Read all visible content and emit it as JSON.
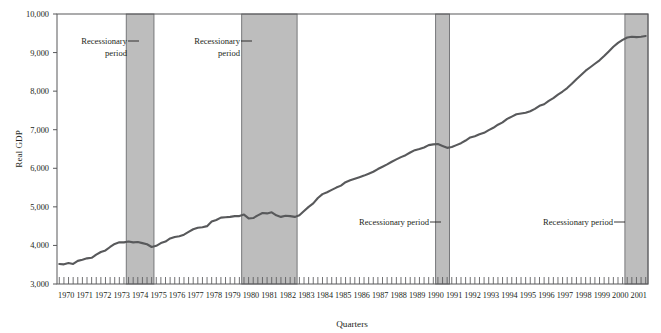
{
  "chart_data": {
    "type": "line",
    "title": "",
    "subtitle": "",
    "xlabel": "Quarters",
    "ylabel": "Real GDP",
    "ylim": [
      3000,
      10000
    ],
    "ytick_labels": [
      "10,000",
      "9,000",
      "8,000",
      "7,000",
      "6,000",
      "5,000",
      "4,000",
      "3,000"
    ],
    "ytick_values": [
      10000,
      9000,
      8000,
      7000,
      6000,
      5000,
      4000,
      3000
    ],
    "grid": false,
    "legend": "none",
    "xlim": [
      "1970Q1",
      "2001Q4"
    ],
    "xtick_labels": [
      "1970",
      "1971",
      "1972",
      "1973",
      "1974",
      "1975",
      "1976",
      "1977",
      "1978",
      "1979",
      "1980",
      "1981",
      "1982",
      "1983",
      "1984",
      "1985",
      "1986",
      "1987",
      "1988",
      "1989",
      "1990",
      "1991",
      "1992",
      "1993",
      "1994",
      "1995",
      "1996",
      "1997",
      "1998",
      "1999",
      "2000",
      "2001"
    ],
    "minor_ticks_per_year": 4,
    "line_color": "#58595b",
    "band_color": "#bdbdbd",
    "band_border_color": "#6d6e71",
    "series": [
      {
        "name": "Real GDP",
        "x": [
          "1970Q1",
          "1970Q2",
          "1970Q3",
          "1970Q4",
          "1971Q1",
          "1971Q2",
          "1971Q3",
          "1971Q4",
          "1972Q1",
          "1972Q2",
          "1972Q3",
          "1972Q4",
          "1973Q1",
          "1973Q2",
          "1973Q3",
          "1973Q4",
          "1974Q1",
          "1974Q2",
          "1974Q3",
          "1974Q4",
          "1975Q1",
          "1975Q2",
          "1975Q3",
          "1975Q4",
          "1976Q1",
          "1976Q2",
          "1976Q3",
          "1976Q4",
          "1977Q1",
          "1977Q2",
          "1977Q3",
          "1977Q4",
          "1978Q1",
          "1978Q2",
          "1978Q3",
          "1978Q4",
          "1979Q1",
          "1979Q2",
          "1979Q3",
          "1979Q4",
          "1980Q1",
          "1980Q2",
          "1980Q3",
          "1980Q4",
          "1981Q1",
          "1981Q2",
          "1981Q3",
          "1981Q4",
          "1982Q1",
          "1982Q2",
          "1982Q3",
          "1982Q4",
          "1983Q1",
          "1983Q2",
          "1983Q3",
          "1983Q4",
          "1984Q1",
          "1984Q2",
          "1984Q3",
          "1984Q4",
          "1985Q1",
          "1985Q2",
          "1985Q3",
          "1985Q4",
          "1986Q1",
          "1986Q2",
          "1986Q3",
          "1986Q4",
          "1987Q1",
          "1987Q2",
          "1987Q3",
          "1987Q4",
          "1988Q1",
          "1988Q2",
          "1988Q3",
          "1988Q4",
          "1989Q1",
          "1989Q2",
          "1989Q3",
          "1989Q4",
          "1990Q1",
          "1990Q2",
          "1990Q3",
          "1990Q4",
          "1991Q1",
          "1991Q2",
          "1991Q3",
          "1991Q4",
          "1992Q1",
          "1992Q2",
          "1992Q3",
          "1992Q4",
          "1993Q1",
          "1993Q2",
          "1993Q3",
          "1993Q4",
          "1994Q1",
          "1994Q2",
          "1994Q3",
          "1994Q4",
          "1995Q1",
          "1995Q2",
          "1995Q3",
          "1995Q4",
          "1996Q1",
          "1996Q2",
          "1996Q3",
          "1996Q4",
          "1997Q1",
          "1997Q2",
          "1997Q3",
          "1997Q4",
          "1998Q1",
          "1998Q2",
          "1998Q3",
          "1998Q4",
          "1999Q1",
          "1999Q2",
          "1999Q3",
          "1999Q4",
          "2000Q1",
          "2000Q2",
          "2000Q3",
          "2000Q4",
          "2001Q1",
          "2001Q2",
          "2001Q3",
          "2001Q4"
        ],
        "values": [
          3520,
          3510,
          3545,
          3520,
          3600,
          3630,
          3665,
          3680,
          3760,
          3830,
          3870,
          3960,
          4040,
          4080,
          4080,
          4100,
          4080,
          4090,
          4060,
          4030,
          3960,
          3990,
          4060,
          4100,
          4180,
          4220,
          4240,
          4280,
          4350,
          4420,
          4460,
          4470,
          4500,
          4620,
          4660,
          4720,
          4730,
          4740,
          4760,
          4760,
          4800,
          4700,
          4710,
          4780,
          4840,
          4830,
          4860,
          4780,
          4740,
          4770,
          4760,
          4740,
          4780,
          4890,
          5000,
          5090,
          5230,
          5330,
          5380,
          5440,
          5500,
          5550,
          5640,
          5690,
          5730,
          5770,
          5810,
          5860,
          5910,
          5980,
          6040,
          6100,
          6170,
          6230,
          6290,
          6340,
          6410,
          6470,
          6500,
          6540,
          6600,
          6620,
          6630,
          6580,
          6530,
          6550,
          6600,
          6650,
          6720,
          6800,
          6830,
          6880,
          6920,
          6990,
          7050,
          7130,
          7190,
          7280,
          7340,
          7400,
          7420,
          7440,
          7480,
          7540,
          7620,
          7660,
          7750,
          7820,
          7910,
          7990,
          8080,
          8190,
          8310,
          8420,
          8530,
          8620,
          8710,
          8800,
          8910,
          9030,
          9150,
          9250,
          9330,
          9390,
          9410,
          9400,
          9410,
          9430
        ]
      }
    ],
    "recession_bands": [
      {
        "start": "1973Q4",
        "end": "1975Q1",
        "label": [
          "Recessionary",
          "period"
        ],
        "label_lines": 2
      },
      {
        "start": "1980Q1",
        "end": "1982Q4",
        "label": [
          "Recessionary",
          "period"
        ],
        "label_lines": 2
      },
      {
        "start": "1990Q3",
        "end": "1991Q1",
        "label": [
          "Recessionary period"
        ],
        "label_lines": 1
      },
      {
        "start": "2000Q4",
        "end": "2001Q4",
        "label": [
          "Recessionary period"
        ],
        "label_lines": 1
      }
    ]
  },
  "annotations": {
    "band1_label_line1": "Recessionary",
    "band1_label_line2": "period",
    "band2_label_line1": "Recessionary",
    "band2_label_line2": "period",
    "band3_label": "Recessionary period",
    "band4_label": "Recessionary period"
  },
  "axis": {
    "ylabel": "Real GDP",
    "xlabel": "Quarters"
  }
}
